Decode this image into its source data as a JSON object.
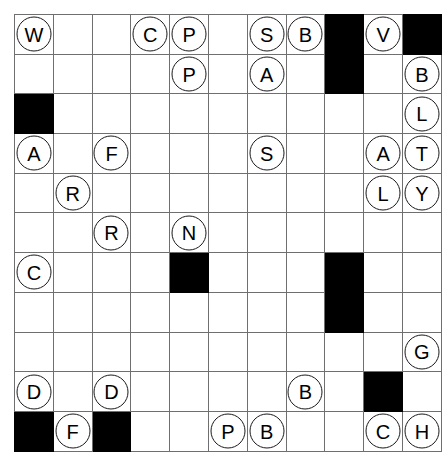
{
  "puzzle": {
    "title": "letter-circle-grid",
    "type": "grid",
    "rows": 11,
    "columns": 11,
    "colors": {
      "cell_background": "#ffffff",
      "blocked_cell": "#000000",
      "grid_line": "#6f6f6f",
      "grid_border": "#3a3a3a",
      "token_fill": "#ffffff",
      "token_stroke": "#1a1a1a",
      "letter_color": "#000000"
    },
    "legend": {
      "empty": "",
      "blocked": "#"
    },
    "cells": [
      [
        "W",
        "",
        "",
        "C",
        "P",
        "",
        "S",
        "B",
        "#",
        "V",
        "#"
      ],
      [
        "",
        "",
        "",
        "",
        "P",
        "",
        "A",
        "",
        "#",
        "",
        "B"
      ],
      [
        "#",
        "",
        "",
        "",
        "",
        "",
        "",
        "",
        "",
        "",
        "L"
      ],
      [
        "A",
        "",
        "F",
        "",
        "",
        "",
        "S",
        "",
        "",
        "A",
        "T"
      ],
      [
        "",
        "R",
        "",
        "",
        "",
        "",
        "",
        "",
        "",
        "L",
        "Y"
      ],
      [
        "",
        "",
        "R",
        "",
        "N",
        "",
        "",
        "",
        "",
        "",
        ""
      ],
      [
        "C",
        "",
        "",
        "",
        "#",
        "",
        "",
        "",
        "#",
        "",
        ""
      ],
      [
        "",
        "",
        "",
        "",
        "",
        "",
        "",
        "",
        "#",
        "",
        ""
      ],
      [
        "",
        "",
        "",
        "",
        "",
        "",
        "",
        "",
        "",
        "",
        "G"
      ],
      [
        "D",
        "",
        "D",
        "",
        "",
        "",
        "",
        "B",
        "",
        "#",
        ""
      ],
      [
        "#",
        "F",
        "#",
        "",
        "",
        "P",
        "B",
        "",
        "",
        "C",
        "H"
      ]
    ],
    "letters_placed": [
      {
        "row": 1,
        "col": 1,
        "letter": "W"
      },
      {
        "row": 1,
        "col": 4,
        "letter": "C"
      },
      {
        "row": 1,
        "col": 5,
        "letter": "P"
      },
      {
        "row": 1,
        "col": 7,
        "letter": "S"
      },
      {
        "row": 1,
        "col": 8,
        "letter": "B"
      },
      {
        "row": 1,
        "col": 10,
        "letter": "V"
      },
      {
        "row": 2,
        "col": 5,
        "letter": "P"
      },
      {
        "row": 2,
        "col": 7,
        "letter": "A"
      },
      {
        "row": 2,
        "col": 11,
        "letter": "B"
      },
      {
        "row": 3,
        "col": 11,
        "letter": "L"
      },
      {
        "row": 4,
        "col": 1,
        "letter": "A"
      },
      {
        "row": 4,
        "col": 3,
        "letter": "F"
      },
      {
        "row": 4,
        "col": 7,
        "letter": "S"
      },
      {
        "row": 4,
        "col": 10,
        "letter": "A"
      },
      {
        "row": 4,
        "col": 11,
        "letter": "T"
      },
      {
        "row": 5,
        "col": 2,
        "letter": "R"
      },
      {
        "row": 5,
        "col": 10,
        "letter": "L"
      },
      {
        "row": 5,
        "col": 11,
        "letter": "Y"
      },
      {
        "row": 6,
        "col": 3,
        "letter": "R"
      },
      {
        "row": 6,
        "col": 5,
        "letter": "N"
      },
      {
        "row": 7,
        "col": 1,
        "letter": "C"
      },
      {
        "row": 9,
        "col": 11,
        "letter": "G"
      },
      {
        "row": 10,
        "col": 1,
        "letter": "D"
      },
      {
        "row": 10,
        "col": 3,
        "letter": "D"
      },
      {
        "row": 10,
        "col": 8,
        "letter": "B"
      },
      {
        "row": 11,
        "col": 2,
        "letter": "F"
      },
      {
        "row": 11,
        "col": 6,
        "letter": "P"
      },
      {
        "row": 11,
        "col": 7,
        "letter": "B"
      },
      {
        "row": 11,
        "col": 10,
        "letter": "C"
      },
      {
        "row": 11,
        "col": 11,
        "letter": "H"
      }
    ],
    "blocked_cells": [
      {
        "row": 1,
        "col": 9
      },
      {
        "row": 1,
        "col": 11
      },
      {
        "row": 2,
        "col": 9
      },
      {
        "row": 3,
        "col": 1
      },
      {
        "row": 7,
        "col": 5
      },
      {
        "row": 7,
        "col": 9
      },
      {
        "row": 8,
        "col": 9
      },
      {
        "row": 10,
        "col": 10
      },
      {
        "row": 11,
        "col": 1
      },
      {
        "row": 11,
        "col": 3
      }
    ]
  }
}
